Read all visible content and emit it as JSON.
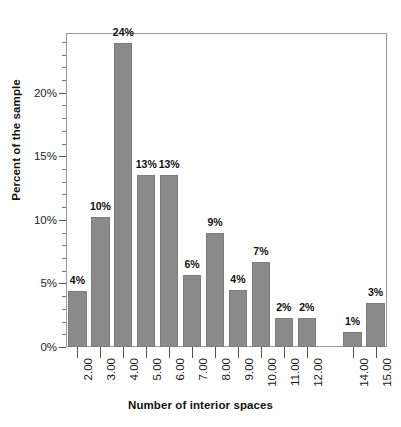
{
  "chart_data": {
    "type": "bar",
    "title": "",
    "subtitle": "",
    "xlabel": "Number of interior spaces",
    "ylabel": "Percent of the sample",
    "categories": [
      "2.00",
      "3.00",
      "4.00",
      "5.00",
      "6.00",
      "7.00",
      "8.00",
      "9.00",
      "10.00",
      "11.00",
      "12.00",
      "13.00",
      "14.00",
      "15.00"
    ],
    "values": [
      4.4,
      10.2,
      23.9,
      13.5,
      13.5,
      5.7,
      9.0,
      4.5,
      6.7,
      2.3,
      2.3,
      0,
      1.2,
      3.5
    ],
    "data_labels": [
      "4%",
      "10%",
      "24%",
      "13%",
      "13%",
      "6%",
      "9%",
      "4%",
      "7%",
      "2%",
      "2%",
      "",
      "1%",
      "3%"
    ],
    "visible_category_labels": [
      "2.00",
      "3.00",
      "4.00",
      "5.00",
      "6.00",
      "7.00",
      "8.00",
      "9.00",
      "10.00",
      "11.00",
      "12.00",
      "",
      "14.00",
      "15.00"
    ],
    "ylim": [
      0,
      24.7
    ],
    "ytick_values": [
      0,
      5,
      10,
      15,
      20
    ],
    "ytick_labels": [
      "0%",
      "5%",
      "10%",
      "15%",
      "20%"
    ],
    "yminor_step": 1,
    "grid": false,
    "legend": "none",
    "bar_color": "#8a8a8a",
    "bar_edge_color": "#7c7c7c",
    "frame_color": "#9a9a9a",
    "text_color": "#111111"
  }
}
